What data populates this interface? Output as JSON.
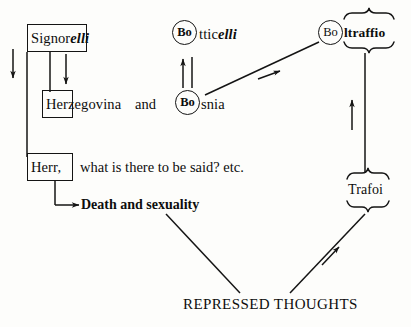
{
  "diagram": {
    "ink_color": "#141414",
    "background_color": "#fdfdfb"
  },
  "nodes": {
    "signorelli": {
      "boxed_part": "Signor",
      "tail_part": "elli",
      "full": "Signorelli"
    },
    "herzegovina": {
      "boxed_part": "Her",
      "tail_part": "zegovina",
      "full": "Herzegovina"
    },
    "conjunction": "and",
    "bosnia": {
      "circled_part": "Bo",
      "tail_part": "snia",
      "full": "Bosnia"
    },
    "botticelli": {
      "circled_part": "Bo",
      "tail_roman": "ttic",
      "tail_italic": "elli",
      "full": "Botticelli"
    },
    "boltraffio": {
      "circled_part": "Bo",
      "braced_part": "ltraffio",
      "full": "Boltraffio"
    },
    "trafoi": {
      "braced_part": "Trafoi",
      "full": "Trafoi"
    },
    "herr": {
      "boxed_part": "Herr,",
      "rest": "what is there to be said? etc.",
      "full": "Herr, what is there to be said? etc."
    },
    "death_and_sexuality": "Death and sexuality",
    "repressed_thoughts": "REPRESSED THOUGHTS"
  },
  "icons": {
    "arrow_down_left": "arrow-down-icon",
    "arrow_down_signorelli": "arrow-down-icon",
    "arrow_right_death": "arrow-right-icon",
    "arrow_up_bosnia_botticelli": "arrow-up-icon",
    "arrow_up_trafoi_boltraffio": "arrow-up-icon",
    "arrow_diag_bosnia_boltraffio": "arrow-up-right-icon",
    "arrow_diag_repressed_trafoi": "arrow-up-right-icon",
    "brace_top_boltraffio": "curly-brace-top-icon",
    "brace_bottom_boltraffio": "curly-brace-bottom-icon",
    "brace_top_trafoi": "curly-brace-top-icon",
    "brace_bottom_trafoi": "curly-brace-bottom-icon"
  }
}
